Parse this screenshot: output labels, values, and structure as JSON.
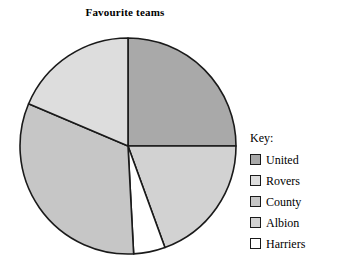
{
  "chart": {
    "title": "Favourite teams"
  },
  "legend": {
    "title": "Key:",
    "entries": [
      {
        "label": "United",
        "color": "#a9a9a9"
      },
      {
        "label": "Rovers",
        "color": "#dddddd"
      },
      {
        "label": "County",
        "color": "#c6c6c6"
      },
      {
        "label": "Albion",
        "color": "#d2d2d2"
      },
      {
        "label": "Harriers",
        "color": "#ffffff"
      }
    ]
  },
  "chart_data": {
    "type": "pie",
    "title": "Favourite teams",
    "xlabel": "",
    "ylabel": "",
    "legend_position": "right",
    "grid": false,
    "start_angle_deg": 0,
    "direction": "clockwise",
    "center": {
      "x": 110,
      "y": 110
    },
    "radius": 108,
    "stroke": "#1a1a1a",
    "stroke_width": 1.6,
    "categories": [
      "United",
      "Albion",
      "Harriers",
      "County",
      "Rovers"
    ],
    "values": [
      25.0,
      19.4,
      4.7,
      32.3,
      18.6
    ],
    "value_unit": "percent",
    "angles_deg": [
      90,
      70,
      17,
      116,
      67
    ],
    "slices": [
      {
        "name": "United",
        "percent": 25.0,
        "angle_deg": 90,
        "start_deg": 0,
        "end_deg": 90,
        "color": "#a9a9a9"
      },
      {
        "name": "Albion",
        "percent": 19.4,
        "angle_deg": 70,
        "start_deg": 90,
        "end_deg": 160,
        "color": "#d2d2d2"
      },
      {
        "name": "Harriers",
        "percent": 4.7,
        "angle_deg": 17,
        "start_deg": 160,
        "end_deg": 177,
        "color": "#ffffff"
      },
      {
        "name": "County",
        "percent": 32.3,
        "angle_deg": 116,
        "start_deg": 177,
        "end_deg": 293,
        "color": "#c6c6c6"
      },
      {
        "name": "Rovers",
        "percent": 18.6,
        "angle_deg": 67,
        "start_deg": 293,
        "end_deg": 360,
        "color": "#dddddd"
      }
    ]
  }
}
